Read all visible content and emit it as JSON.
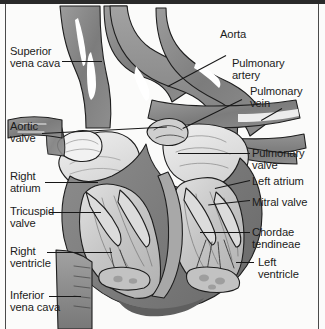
{
  "figure": {
    "type": "anatomical-diagram",
    "style": "grayscale line illustration",
    "colors": {
      "background": "#fbfbfa",
      "frame": "#2a2a2a",
      "vessel_dark": "#7f7f7f",
      "vessel_mid": "#9a9a9a",
      "chamber_light": "#c9c9c9",
      "chamber_pale": "#e2e2e2",
      "outline": "#1e1e1e",
      "label_text": "#1b1b1b",
      "leader_line": "#171717"
    }
  },
  "labels": {
    "left": [
      {
        "id": "superior-vena-cava",
        "text": "Superior\nvena cava"
      },
      {
        "id": "aortic-valve",
        "text": "Aortic\nvalve"
      },
      {
        "id": "right-atrium",
        "text": "Right\natrium"
      },
      {
        "id": "tricuspid-valve",
        "text": "Tricuspid\nvalve"
      },
      {
        "id": "right-ventricle",
        "text": "Right\nventricle"
      },
      {
        "id": "inferior-vena-cava",
        "text": "Inferior\nvena cava"
      }
    ],
    "right": [
      {
        "id": "aorta",
        "text": "Aorta"
      },
      {
        "id": "pulmonary-artery",
        "text": "Pulmonary\nartery"
      },
      {
        "id": "pulmonary-vein",
        "text": "Pulmonary\nvein"
      },
      {
        "id": "pulmonary-valve",
        "text": "Pulmonary\nvalve"
      },
      {
        "id": "left-atrium",
        "text": "Left atrium"
      },
      {
        "id": "mitral-valve",
        "text": "Mitral valve"
      },
      {
        "id": "chordae-tendineae",
        "text": "Chordae\ntendineae"
      },
      {
        "id": "left-ventricle",
        "text": "Left\nventricle"
      }
    ]
  }
}
